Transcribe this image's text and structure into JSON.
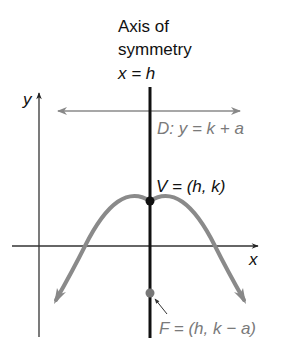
{
  "diagram": {
    "type": "parabola-opening-down",
    "title_lines": [
      "Axis of",
      "symmetry",
      "x = h"
    ],
    "axis_labels": {
      "x": "x",
      "y": "y"
    },
    "directrix_label": "D: y = k + a",
    "vertex_label": "V = (h, k)",
    "focus_label": "F = (h, k − a)",
    "colors": {
      "axes": "#333333",
      "axis_of_symmetry": "#111111",
      "parabola": "#8a8a8a",
      "directrix": "#8a8a8a",
      "vertex_point": "#111111",
      "focus_point": "#777777",
      "label_dark": "#111111",
      "label_gray": "#7a7a7a"
    }
  }
}
